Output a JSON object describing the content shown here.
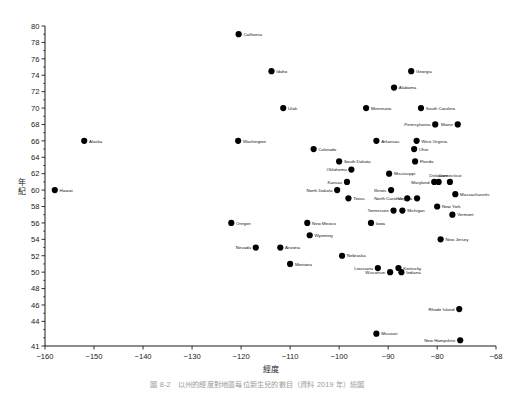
{
  "figure": {
    "title": "",
    "caption": "圖 8-2　以州的經度對地區每位新生兒的數目（資料 2019 年）繪圖",
    "width": 515,
    "height": 394
  },
  "chart_data": {
    "type": "scatter",
    "title": "",
    "xlabel": "經度",
    "ylabel": "年紀",
    "xlim": [
      -160,
      -68
    ],
    "ylim": [
      41,
      80
    ],
    "xticks": [
      -160,
      -150,
      -140,
      -130,
      -120,
      -110,
      -100,
      -90,
      -80,
      -68
    ],
    "yticks": [
      41,
      44,
      46,
      48,
      50,
      52,
      54,
      56,
      58,
      60,
      62,
      64,
      66,
      68,
      70,
      72,
      74,
      76,
      78,
      80
    ],
    "ytick_labels": [
      "41",
      "44",
      "46",
      "48",
      "50",
      "52",
      "54",
      "56",
      "58",
      "60",
      "62",
      "64",
      "66",
      "68",
      "70",
      "72",
      "74",
      "76",
      "78",
      "80"
    ],
    "grid": false,
    "legend": false,
    "marker": "filled-circle",
    "marker_color": "#000000",
    "points": [
      {
        "label": "Hawaii",
        "x": -158.0,
        "y": 60.0,
        "lp": "right"
      },
      {
        "label": "Alaska",
        "x": -152.0,
        "y": 66.0,
        "lp": "right"
      },
      {
        "label": "Oregon",
        "x": -122.0,
        "y": 56.0,
        "lp": "right"
      },
      {
        "label": "California",
        "x": -120.5,
        "y": 79.0,
        "lp": "right"
      },
      {
        "label": "Washington",
        "x": -120.6,
        "y": 66.0,
        "lp": "right"
      },
      {
        "label": "Nevada",
        "x": -117.0,
        "y": 53.0,
        "lp": "left"
      },
      {
        "label": "Idaho",
        "x": -113.8,
        "y": 74.5,
        "lp": "right"
      },
      {
        "label": "Arizona",
        "x": -112.0,
        "y": 53.0,
        "lp": "right"
      },
      {
        "label": "Utah",
        "x": -111.4,
        "y": 70.0,
        "lp": "right"
      },
      {
        "label": "Montana",
        "x": -110.0,
        "y": 51.0,
        "lp": "right"
      },
      {
        "label": "New Mexico",
        "x": -106.5,
        "y": 56.0,
        "lp": "right"
      },
      {
        "label": "Wyoming",
        "x": -106.0,
        "y": 54.5,
        "lp": "right"
      },
      {
        "label": "Colorado",
        "x": -105.2,
        "y": 65.0,
        "lp": "right"
      },
      {
        "label": "North Dakota",
        "x": -100.4,
        "y": 60.0,
        "lp": "left"
      },
      {
        "label": "South Dakota",
        "x": -100.0,
        "y": 63.5,
        "lp": "right"
      },
      {
        "label": "Nebraska",
        "x": -99.4,
        "y": 52.0,
        "lp": "right"
      },
      {
        "label": "Kansas",
        "x": -98.4,
        "y": 61.0,
        "lp": "left"
      },
      {
        "label": "Texas",
        "x": -98.1,
        "y": 59.0,
        "lp": "right"
      },
      {
        "label": "Oklahoma",
        "x": -97.5,
        "y": 62.5,
        "lp": "left"
      },
      {
        "label": "Minnesota",
        "x": -94.5,
        "y": 70.0,
        "lp": "right"
      },
      {
        "label": "Iowa",
        "x": -93.5,
        "y": 56.0,
        "lp": "right"
      },
      {
        "label": "Arkansas",
        "x": -92.4,
        "y": 66.0,
        "lp": "right"
      },
      {
        "label": "Louisiana",
        "x": -92.1,
        "y": 50.5,
        "lp": "left"
      },
      {
        "label": "Missouri",
        "x": -92.4,
        "y": 42.5,
        "lp": "right"
      },
      {
        "label": "Illinois",
        "x": -89.4,
        "y": 60.0,
        "lp": "left"
      },
      {
        "label": "Mississippi",
        "x": -89.8,
        "y": 62.0,
        "lp": "right"
      },
      {
        "label": "Wisconsin",
        "x": -89.6,
        "y": 50.0,
        "lp": "left"
      },
      {
        "label": "Tennessee",
        "x": -88.9,
        "y": 57.5,
        "lp": "left"
      },
      {
        "label": "Alabama",
        "x": -88.8,
        "y": 72.5,
        "lp": "right"
      },
      {
        "label": "Kentucky",
        "x": -87.9,
        "y": 50.5,
        "lp": "right"
      },
      {
        "label": "Indiana",
        "x": -87.3,
        "y": 50.0,
        "lp": "right"
      },
      {
        "label": "Michigan",
        "x": -87.1,
        "y": 57.5,
        "lp": "right"
      },
      {
        "label": "North Carolina",
        "x": -86.1,
        "y": 59.0,
        "lp": "left"
      },
      {
        "label": "Georgia",
        "x": -85.3,
        "y": 74.5,
        "lp": "right"
      },
      {
        "label": "Ohio",
        "x": -84.7,
        "y": 65.0,
        "lp": "right"
      },
      {
        "label": "Florida",
        "x": -84.5,
        "y": 63.5,
        "lp": "right"
      },
      {
        "label": "West Virginia",
        "x": -84.2,
        "y": 66.0,
        "lp": "right"
      },
      {
        "label": "Virginia",
        "x": -84.1,
        "y": 59.0,
        "lp": "left"
      },
      {
        "label": "South Carolina",
        "x": -83.3,
        "y": 70.0,
        "lp": "right"
      },
      {
        "label": "Maryland",
        "x": -80.6,
        "y": 61.0,
        "lp": "left"
      },
      {
        "label": "Pennsylvania",
        "x": -80.4,
        "y": 68.0,
        "lp": "left"
      },
      {
        "label": "New York",
        "x": -80.0,
        "y": 58.0,
        "lp": "right"
      },
      {
        "label": "Delaware",
        "x": -79.7,
        "y": 61.0,
        "lp": "top"
      },
      {
        "label": "New Jersey",
        "x": -79.3,
        "y": 54.0,
        "lp": "right"
      },
      {
        "label": "Connecticut",
        "x": -77.4,
        "y": 61.0,
        "lp": "top"
      },
      {
        "label": "Massachusetts",
        "x": -76.3,
        "y": 59.5,
        "lp": "right"
      },
      {
        "label": "Vermont",
        "x": -76.9,
        "y": 57.0,
        "lp": "right"
      },
      {
        "label": "Maine",
        "x": -75.8,
        "y": 68.0,
        "lp": "left"
      },
      {
        "label": "Rhode Island",
        "x": -75.5,
        "y": 45.5,
        "lp": "left"
      },
      {
        "label": "New Hampshire",
        "x": -75.3,
        "y": 41.7,
        "lp": "left"
      }
    ]
  }
}
